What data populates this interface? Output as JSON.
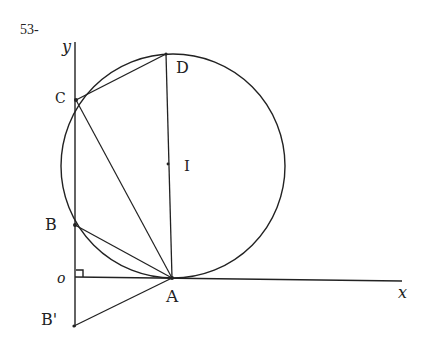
{
  "problem_number": "53-",
  "axes": {
    "x_label": "x",
    "y_label": "y",
    "origin_label": "o"
  },
  "points": {
    "O": {
      "label": "o",
      "x": 75,
      "y": 277
    },
    "A": {
      "label": "A",
      "x": 172,
      "y": 278
    },
    "B": {
      "label": "B",
      "x": 75,
      "y": 225
    },
    "B_prime": {
      "label": "B'",
      "x": 74,
      "y": 326
    },
    "C": {
      "label": "C",
      "x": 76,
      "y": 100
    },
    "D": {
      "label": "D",
      "x": 166,
      "y": 54
    },
    "I": {
      "label": "I",
      "x": 169,
      "y": 165
    }
  },
  "circle": {
    "center": "I",
    "cx": 173,
    "cy": 166,
    "r": 112
  },
  "segments": [
    "CD",
    "CA",
    "DA",
    "BA",
    "B'A",
    "OA (x-axis)",
    "OB' (y-axis)"
  ],
  "annotations": [
    "right-angle marker at O"
  ],
  "colors": {
    "ink": "#222222",
    "background": "#ffffff"
  }
}
